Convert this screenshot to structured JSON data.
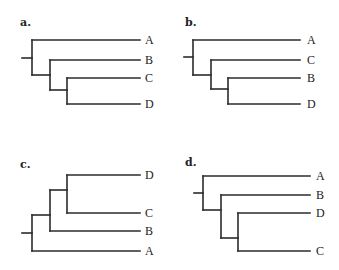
{
  "colors": {
    "line": "#2b2b2b",
    "text": "#222222",
    "background": "#ffffff"
  },
  "panels": [
    {
      "label": "a.",
      "topology": "(A,(B,(C,D)))",
      "tips": [
        {
          "name": "A",
          "y": 40
        },
        {
          "name": "B",
          "y": 60
        },
        {
          "name": "C",
          "y": 78
        },
        {
          "name": "D",
          "y": 104
        }
      ]
    },
    {
      "label": "b.",
      "topology": "(A,(C,(B,D)))",
      "tips": [
        {
          "name": "A",
          "y": 40
        },
        {
          "name": "C",
          "y": 60
        },
        {
          "name": "B",
          "y": 78
        },
        {
          "name": "D",
          "y": 104
        }
      ]
    },
    {
      "label": "c.",
      "topology": "(((D,C),B),A)",
      "tips": [
        {
          "name": "D",
          "y": 175
        },
        {
          "name": "C",
          "y": 213
        },
        {
          "name": "B",
          "y": 231
        },
        {
          "name": "A",
          "y": 251
        }
      ]
    },
    {
      "label": "d.",
      "topology": "(A,(B,(D,C)))",
      "tips": [
        {
          "name": "A",
          "y": 176
        },
        {
          "name": "B",
          "y": 195
        },
        {
          "name": "D",
          "y": 213
        },
        {
          "name": "C",
          "y": 251
        }
      ]
    }
  ]
}
